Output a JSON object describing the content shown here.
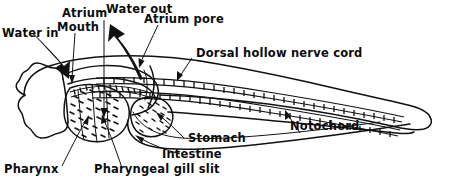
{
  "figure": {
    "style": "black-and-white line drawing",
    "background_color": "#ffffff",
    "ink_color": "#111111"
  },
  "labels": {
    "water_in": "Water in",
    "mouth": "Mouth",
    "atrium": "Atrium",
    "water_out": "Water out",
    "atrium_pore": "Atrium pore",
    "dorsal_nerve_cord": "Dorsal hollow nerve cord",
    "notochord": "Notochord",
    "stomach": "Stomach",
    "intestine": "Intestine",
    "pharyngeal_gill_slit": "Pharyngeal gill slit",
    "pharynx": "Pharynx"
  },
  "caption": {
    "clipped_line": ""
  }
}
